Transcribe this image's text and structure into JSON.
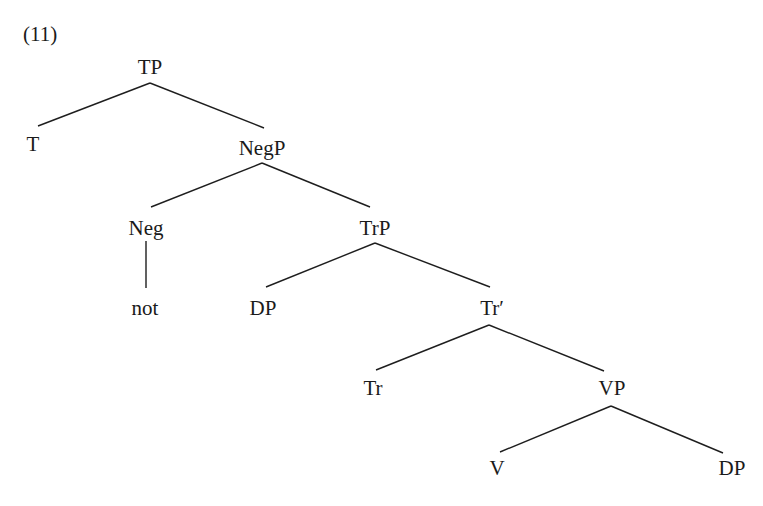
{
  "example_number": "(11)",
  "tree": {
    "nodes": [
      {
        "id": "TP",
        "label": "TP",
        "x": 150,
        "y": 55
      },
      {
        "id": "T",
        "label": "T",
        "x": 33,
        "y": 132
      },
      {
        "id": "NegP",
        "label": "NegP",
        "x": 262,
        "y": 136
      },
      {
        "id": "Neg",
        "label": "Neg",
        "x": 146,
        "y": 216
      },
      {
        "id": "TrP",
        "label": "TrP",
        "x": 375,
        "y": 216
      },
      {
        "id": "not",
        "label": "not",
        "x": 145,
        "y": 296
      },
      {
        "id": "DP1",
        "label": "DP",
        "x": 263,
        "y": 296
      },
      {
        "id": "TrBar",
        "label": "Tr′",
        "x": 492,
        "y": 296
      },
      {
        "id": "Tr",
        "label": "Tr",
        "x": 373,
        "y": 376
      },
      {
        "id": "VP",
        "label": "VP",
        "x": 612,
        "y": 376
      },
      {
        "id": "V",
        "label": "V",
        "x": 497,
        "y": 456
      },
      {
        "id": "DP2",
        "label": "DP",
        "x": 732,
        "y": 456
      }
    ],
    "edges": [
      {
        "from": "TP",
        "to": "T",
        "x1": 150,
        "y1": 83,
        "x2": 38,
        "y2": 126
      },
      {
        "from": "TP",
        "to": "NegP",
        "x1": 150,
        "y1": 83,
        "x2": 264,
        "y2": 128
      },
      {
        "from": "NegP",
        "to": "Neg",
        "x1": 262,
        "y1": 163,
        "x2": 151,
        "y2": 207
      },
      {
        "from": "NegP",
        "to": "TrP",
        "x1": 262,
        "y1": 163,
        "x2": 370,
        "y2": 207
      },
      {
        "from": "Neg",
        "to": "not",
        "x1": 146,
        "y1": 241,
        "x2": 146,
        "y2": 288
      },
      {
        "from": "TrP",
        "to": "DP1",
        "x1": 375,
        "y1": 243,
        "x2": 266,
        "y2": 287
      },
      {
        "from": "TrP",
        "to": "TrBar",
        "x1": 375,
        "y1": 243,
        "x2": 490,
        "y2": 287
      },
      {
        "from": "TrBar",
        "to": "Tr",
        "x1": 489,
        "y1": 325,
        "x2": 376,
        "y2": 370
      },
      {
        "from": "TrBar",
        "to": "VP",
        "x1": 489,
        "y1": 325,
        "x2": 604,
        "y2": 371
      },
      {
        "from": "VP",
        "to": "V",
        "x1": 611,
        "y1": 406,
        "x2": 500,
        "y2": 452
      },
      {
        "from": "VP",
        "to": "DP2",
        "x1": 611,
        "y1": 406,
        "x2": 723,
        "y2": 453
      }
    ]
  }
}
